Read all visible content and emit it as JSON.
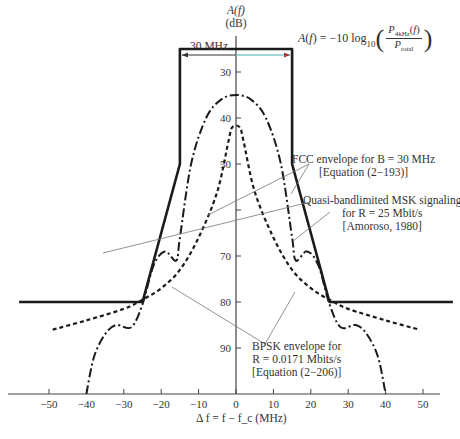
{
  "chart_data": {
    "type": "line",
    "title": "",
    "xlabel": "Δf = f − f_c (MHz)",
    "ylabel": "A(f) (dB)",
    "xlim": [
      -55,
      55
    ],
    "ylim": [
      100,
      25
    ],
    "y_inverted": true,
    "x_ticks": [
      -50,
      -40,
      -30,
      -20,
      -10,
      0,
      10,
      20,
      30,
      40,
      50
    ],
    "y_ticks": [
      30,
      40,
      50,
      60,
      70,
      80,
      90
    ],
    "y_tick_labels_shown": [
      30,
      40,
      50,
      70,
      80,
      90
    ],
    "grid": false,
    "legend": "none (inline annotations)",
    "formula": "A(f) = -10 log10( P_4kHz(f) / P_total )",
    "bandwidth_marker": {
      "label": "30 MHz",
      "x_from": -15,
      "x_to": 15
    },
    "series": [
      {
        "name": "FCC envelope for B = 30 MHz [Equation (2-193)]",
        "style": "solid-thick",
        "x": [
          -58,
          -25,
          -15,
          -15,
          15,
          15,
          25,
          58
        ],
        "y": [
          80,
          80,
          50,
          25,
          25,
          50,
          80,
          80
        ]
      },
      {
        "name": "Quasi-bandlimited MSK signaling for R = 25 Mbit/s [Amoroso, 1980]",
        "style": "dash-dot",
        "x": [
          -40,
          -38,
          -35,
          -32,
          -28,
          -25,
          -22,
          -19,
          -16,
          -15,
          -12,
          -8,
          -4,
          0,
          4,
          8,
          12,
          15,
          16,
          19,
          22,
          25,
          28,
          32,
          35,
          38,
          40
        ],
        "y": [
          100,
          92,
          87,
          85,
          85.5,
          80.5,
          72,
          69,
          71,
          66,
          50,
          40,
          36,
          35,
          36,
          40,
          50,
          66,
          71,
          69,
          72,
          80.5,
          85.5,
          85,
          87,
          92,
          100
        ]
      },
      {
        "name": "BPSK envelope for R = 0.0171 Mbits/s [Equation (2-206)]",
        "style": "dashed",
        "x": [
          -49,
          -40,
          -30,
          -25,
          -20,
          -15,
          -10,
          -5,
          -2,
          -1,
          1,
          2,
          5,
          10,
          15,
          20,
          25,
          30,
          40,
          49
        ],
        "y": [
          86,
          84,
          81.5,
          79.5,
          77,
          73,
          66,
          56,
          45,
          42,
          42,
          45,
          56,
          66,
          73,
          77,
          79.5,
          81.5,
          84,
          86
        ]
      }
    ]
  },
  "labels": {
    "y_axis_name": "A(f)",
    "y_axis_unit": "(dB)",
    "x_axis_label": "Δ f = f − f_c (MHz)",
    "bandwidth": "30 MHz",
    "formula_lhs": "A(f) = −10 log",
    "formula_sub": "10",
    "formula_num": "P4kHz(f)",
    "formula_den": "Ptotal",
    "fcc_line1": "FCC envelope for B = 30 MHz",
    "fcc_line2": "[Equation (2−193)]",
    "msk_line1": "Quasi-bandlimited MSK signaling",
    "msk_line2": "for R = 25 Mbit/s",
    "msk_line3": "[Amoroso, 1980]",
    "bpsk_line1": "BPSK envelope for",
    "bpsk_line2": "R = 0.0171 Mbits/s",
    "bpsk_line3": "[Equation (2−206)]"
  },
  "colors": {
    "ink": "#1a1a1a",
    "axis": "#444444",
    "leader": "#777777",
    "marker_tint": "#7fc8c8"
  }
}
